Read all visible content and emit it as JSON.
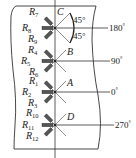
{
  "diagram": {
    "type": "strain-gauge-rosette-layout",
    "colors": {
      "line": "#333333",
      "gauge": "#555555",
      "background": "#ffffff"
    },
    "points": [
      {
        "id": "C",
        "label": "C",
        "angle_label": "180",
        "y": 28,
        "gauges": [
          "R7",
          "R8",
          "R9"
        ]
      },
      {
        "id": "B",
        "label": "B",
        "angle_label": "90",
        "y": 61,
        "gauges": [
          "R4",
          "R5",
          "R6"
        ]
      },
      {
        "id": "A",
        "label": "A",
        "angle_label": "0",
        "y": 92,
        "gauges": [
          "R1",
          "R2",
          "R3"
        ]
      },
      {
        "id": "D",
        "label": "D",
        "angle_label": "270",
        "y": 125,
        "gauges": [
          "R10",
          "R11",
          "R12"
        ]
      }
    ],
    "gauge_labels": {
      "R7": {
        "main": "R",
        "sub": "7"
      },
      "R8": {
        "main": "R",
        "sub": "8"
      },
      "R9": {
        "main": "R",
        "sub": "9"
      },
      "R4": {
        "main": "R",
        "sub": "4"
      },
      "R5": {
        "main": "R",
        "sub": "5"
      },
      "R6": {
        "main": "R",
        "sub": "6"
      },
      "R1": {
        "main": "R",
        "sub": "1"
      },
      "R2": {
        "main": "R",
        "sub": "2"
      },
      "R3": {
        "main": "R",
        "sub": "3"
      },
      "R10": {
        "main": "R",
        "sub": "10"
      },
      "R11": {
        "main": "R",
        "sub": "11"
      },
      "R12": {
        "main": "R",
        "sub": "12"
      }
    },
    "angle_annotations": {
      "upper": "45°",
      "lower": "45°"
    },
    "position_labels": {
      "p180": "180",
      "p90": "90",
      "p0": "0",
      "p270": "270",
      "degree_symbol": "°"
    }
  }
}
